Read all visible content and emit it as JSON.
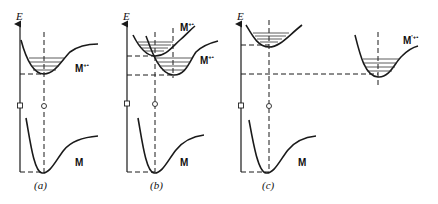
{
  "figure": {
    "axis_label": "E",
    "panels": [
      {
        "id": "a",
        "caption": "(a)",
        "labels": {
          "upper": "M",
          "upper_sup": "+•",
          "lower": "M"
        }
      },
      {
        "id": "b",
        "caption": "(b)",
        "labels": {
          "upper_1": "M",
          "upper_1_sup": "+•",
          "upper_2": "M",
          "upper_2_sup": "+•",
          "lower": "M"
        }
      },
      {
        "id": "c",
        "caption": "(c)",
        "labels": {
          "shifted": "M",
          "shifted_sup": "'+•",
          "lower": "M"
        }
      }
    ]
  }
}
